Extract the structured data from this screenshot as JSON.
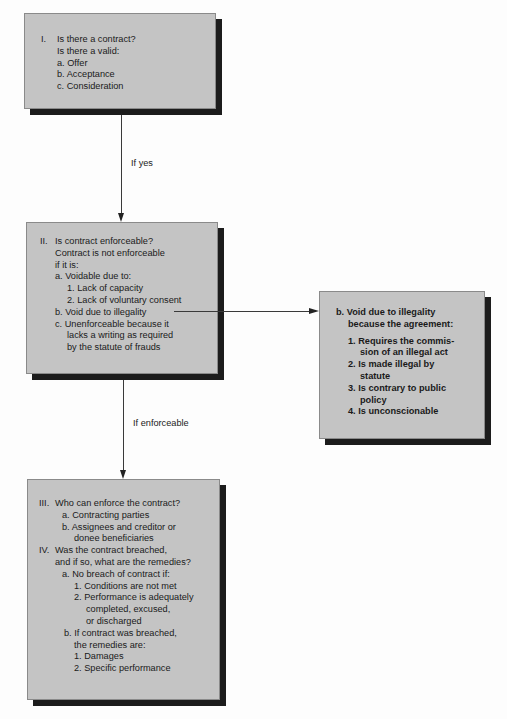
{
  "box1": {
    "numeral": "I.",
    "lines": [
      "Is there a contract?",
      "Is there a valid:",
      "a. Offer",
      "b. Acceptance",
      "c. Consideration"
    ]
  },
  "connector1": {
    "label": "If yes"
  },
  "box2": {
    "numeral": "II.",
    "lines": [
      "Is contract enforceable?",
      "Contract is not enforceable",
      "if it is:",
      "a. Voidable due to:",
      "1. Lack of capacity",
      "2. Lack of voluntary consent",
      "b. Void due to illegality",
      "c. Unenforceable because it",
      "lacks a writing as required",
      "by the statute of frauds"
    ]
  },
  "connector2": {
    "label": "If enforceable"
  },
  "box3": {
    "heading": [
      "b. Void due to illegality",
      "because the agreement:"
    ],
    "items": [
      "1. Requires the commis-",
      "sion of an illegal act",
      "2. Is made illegal by",
      "statute",
      "3. Is contrary to public",
      "policy",
      "4. Is unconscionable"
    ]
  },
  "box4": {
    "section3_numeral": "III.",
    "section3_lines": [
      "Who can enforce the contract?",
      "a. Contracting parties",
      "b. Assignees and creditor or",
      "donee beneficiaries"
    ],
    "section4_numeral": "IV.",
    "section4_lines": [
      "Was the contract breached,",
      "and if so, what are the remedies?",
      "a. No breach of contract if:",
      "1. Conditions are not met",
      "2. Performance is adequately",
      "completed, excused,",
      "or discharged",
      "b. If contract was breached,",
      "the remedies are:",
      "1. Damages",
      "2. Specific performance"
    ]
  },
  "colors": {
    "box_fill": "#c4c4c4",
    "shadow": "#1c1c1c",
    "line": "#3a3a3a"
  }
}
